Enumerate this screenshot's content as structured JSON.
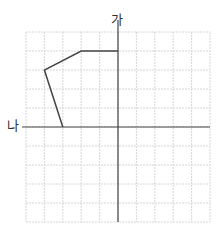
{
  "diagram": {
    "type": "grid-figure-symmetry",
    "grid": {
      "columns": 10,
      "rows": 10,
      "x0": 26,
      "y0": 32,
      "cell_w": 18.4,
      "cell_h": 19,
      "color": "#d6d6d6"
    },
    "axes": {
      "vertical": {
        "label": "가",
        "column": 5
      },
      "horizontal": {
        "label": "나",
        "row": 5
      }
    },
    "polyline_points_grid": [
      [
        5,
        1
      ],
      [
        3,
        1
      ],
      [
        1,
        2
      ],
      [
        2,
        5
      ]
    ],
    "line_color": "#444444"
  }
}
